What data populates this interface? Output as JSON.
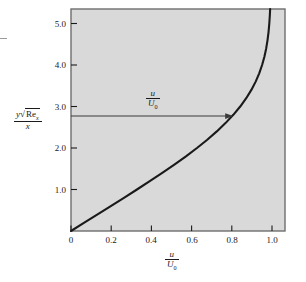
{
  "figure": {
    "background_color": "#ffffff",
    "plot_fill_color": "#d9d9d9",
    "frame_color": "#6e6e6e",
    "curve_color": "#1a1a1a",
    "annotation_color": "#3a3a3a"
  },
  "chart_data": {
    "type": "line",
    "title": "",
    "xlabel": "u/U0",
    "ylabel": "y*sqrt(Re_x)/x",
    "xlim": [
      0.0,
      1.07
    ],
    "ylim": [
      0.0,
      5.35
    ],
    "grid": false,
    "legend": "none",
    "x_ticks": [
      "0",
      "0.2",
      "0.4",
      "0.6",
      "0.8",
      "1.0"
    ],
    "x_tick_values": [
      0.0,
      0.2,
      0.4,
      0.6,
      0.8,
      1.0
    ],
    "y_ticks": [
      "1.0",
      "2.0",
      "3.0",
      "4.0",
      "5.0"
    ],
    "y_tick_values": [
      1.0,
      2.0,
      3.0,
      4.0,
      5.0
    ],
    "series": [
      {
        "name": "Blasius laminar boundary layer velocity profile",
        "x_label": "u/U0",
        "y_label": "eta = y*sqrt(Re_x)/x",
        "x": [
          0.0,
          0.0664,
          0.1328,
          0.1989,
          0.2647,
          0.3298,
          0.3938,
          0.4563,
          0.5168,
          0.5748,
          0.6298,
          0.6813,
          0.729,
          0.7725,
          0.8115,
          0.8461,
          0.8761,
          0.9018,
          0.9233,
          0.9411,
          0.9555,
          0.967,
          0.9759,
          0.9827,
          0.9878,
          0.9915,
          0.9942,
          0.9962,
          0.9975,
          0.9984,
          0.999,
          0.9994,
          0.9997,
          0.9998,
          0.9999,
          1.0,
          1.0
        ],
        "y": [
          0.0,
          0.2,
          0.4,
          0.6,
          0.8,
          1.0,
          1.2,
          1.4,
          1.6,
          1.8,
          2.0,
          2.2,
          2.4,
          2.6,
          2.8,
          3.0,
          3.2,
          3.4,
          3.6,
          3.8,
          4.0,
          4.2,
          4.4,
          4.6,
          4.8,
          5.0,
          5.2,
          5.4,
          5.6,
          5.8,
          6.0,
          6.2,
          6.4,
          6.6,
          6.8,
          7.0,
          7.2
        ]
      }
    ],
    "annotations": [
      {
        "name": "velocity-ratio-arrow",
        "type": "arrow",
        "label": "u/U0",
        "y_value": 2.77,
        "x_start": 0.0,
        "x_end": 0.811
      }
    ]
  },
  "axes": {
    "x_tick_labels": [
      {
        "text": "0",
        "value": 0.0
      },
      {
        "text": "0.2",
        "value": 0.2
      },
      {
        "text": "0.4",
        "value": 0.4
      },
      {
        "text": "0.6",
        "value": 0.6
      },
      {
        "text": "0.8",
        "value": 0.8
      },
      {
        "text": "1.0",
        "value": 1.0
      }
    ],
    "y_tick_labels": [
      {
        "text": "1.0",
        "value": 1.0
      },
      {
        "text": "2.0",
        "value": 2.0
      },
      {
        "text": "3.0",
        "value": 3.0
      },
      {
        "text": "4.0",
        "value": 4.0
      },
      {
        "text": "5.0",
        "value": 5.0
      }
    ],
    "x_axis_label": {
      "numerator": "u",
      "denominator": "U",
      "denominator_sub": "0"
    },
    "y_axis_label": {
      "numerator_var": "y",
      "numerator_radicand": "Re",
      "numerator_radicand_sub": "x",
      "denominator": "x"
    }
  },
  "annotation_label": {
    "numerator": "u",
    "denominator": "U",
    "denominator_sub": "0"
  }
}
